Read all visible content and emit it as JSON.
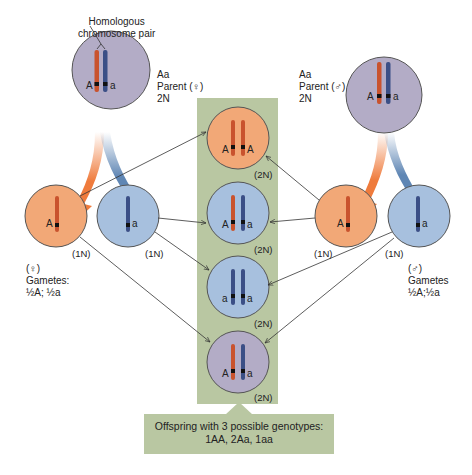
{
  "colors": {
    "parent_cell": "#b3acc6",
    "female_gamete_cell": "#f2a877",
    "male_gamete_cell": "#a7c0de",
    "panel_green": "#b9c7a2",
    "chromosome_A": "#c9532e",
    "chromosome_a": "#3b4f86",
    "arrow_orange": "#ef7b3c",
    "arrow_blue": "#5f86b4"
  },
  "annotation": {
    "homologous_pair_line1": "Homologous",
    "homologous_pair_line2": "chromosome pair"
  },
  "parent_female": {
    "genotype": "Aa",
    "label": "Parent (♀)",
    "ploidy": "2N",
    "alleles": [
      "A",
      "a"
    ]
  },
  "parent_male": {
    "genotype": "Aa",
    "label": "Parent (♂)",
    "ploidy": "2N",
    "alleles": [
      "A",
      "a"
    ]
  },
  "female_gametes": {
    "sex_symbol": "(♀)",
    "title": "Gametes:",
    "ratio": "½A; ½a",
    "cells": [
      {
        "allele": "A",
        "ploidy": "(1N)"
      },
      {
        "allele": "a",
        "ploidy": "(1N)"
      }
    ]
  },
  "male_gametes": {
    "sex_symbol": "(♂)",
    "title": "Gametes",
    "ratio": "½A;½a",
    "cells": [
      {
        "allele": "A",
        "ploidy": "(1N)"
      },
      {
        "allele": "a",
        "ploidy": "(1N)"
      }
    ]
  },
  "offspring": [
    {
      "genotype": "AA",
      "alleles": [
        "A",
        "A"
      ],
      "ploidy": "(2N)"
    },
    {
      "genotype": "Aa",
      "alleles": [
        "A",
        "a"
      ],
      "ploidy": "(2N)"
    },
    {
      "genotype": "aa",
      "alleles": [
        "a",
        "a"
      ],
      "ploidy": "(2N)"
    },
    {
      "genotype": "Aa",
      "alleles": [
        "A",
        "a"
      ],
      "ploidy": "(2N)"
    }
  ],
  "caption": {
    "line1": "Offspring with 3 possible genotypes:",
    "line2": "1AA, 2Aa, 1aa"
  }
}
